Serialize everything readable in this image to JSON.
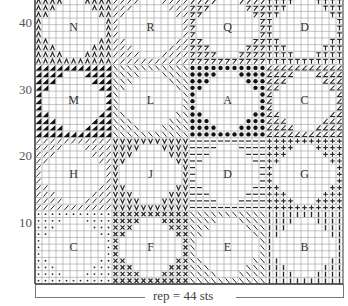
{
  "chart_title": "",
  "grid": {
    "columns": 44,
    "rows_visible": 44,
    "origin_x": 35,
    "bottom_y": 284,
    "cell_w": 7,
    "cell_h": 6.65,
    "line_color": "#9a9a9a",
    "symbol_color": "#2a2a2a",
    "border_color": "#333333"
  },
  "row_labels": [
    {
      "row": 10,
      "label": "10"
    },
    {
      "row": 20,
      "label": "20"
    },
    {
      "row": 30,
      "label": "30"
    },
    {
      "row": 40,
      "label": "40"
    }
  ],
  "repeat_label": "rep = 44 sts",
  "blocks": [
    {
      "letter": "C",
      "band": 0,
      "col": 0,
      "symbol": "dot"
    },
    {
      "letter": "F",
      "band": 0,
      "col": 1,
      "symbol": "cross"
    },
    {
      "letter": "E",
      "band": 0,
      "col": 2,
      "symbol": "backslash"
    },
    {
      "letter": "B",
      "band": 0,
      "col": 3,
      "symbol": "vbar"
    },
    {
      "letter": "H",
      "band": 1,
      "col": 0,
      "symbol": "slash"
    },
    {
      "letter": "J",
      "band": 1,
      "col": 1,
      "symbol": "vee"
    },
    {
      "letter": "D",
      "band": 1,
      "col": 2,
      "symbol": "dash"
    },
    {
      "letter": "G",
      "band": 1,
      "col": 3,
      "symbol": "plus"
    },
    {
      "letter": "M",
      "band": 2,
      "col": 0,
      "symbol": "blacktri"
    },
    {
      "letter": "L",
      "band": 2,
      "col": 1,
      "symbol": "backslash"
    },
    {
      "letter": "A",
      "band": 2,
      "col": 2,
      "symbol": "bigdot"
    },
    {
      "letter": "C",
      "band": 2,
      "col": 3,
      "symbol": "angle"
    },
    {
      "letter": "N",
      "band": 3,
      "col": 0,
      "symbol": "lambda"
    },
    {
      "letter": "R",
      "band": 3,
      "col": 1,
      "symbol": "slash"
    },
    {
      "letter": "Q",
      "band": 3,
      "col": 2,
      "symbol": "seven"
    },
    {
      "letter": "D",
      "band": 3,
      "col": 3,
      "symbol": "tee"
    }
  ],
  "chart_data": {
    "type": "table",
    "repeat_stitches": 44,
    "row_ticks": [
      10,
      20,
      30,
      40
    ],
    "block_size": {
      "stitches": 11,
      "rows": 11
    },
    "layout_rows_bottom_to_top": [
      [
        "C",
        "F",
        "E",
        "B"
      ],
      [
        "H",
        "J",
        "D",
        "G"
      ],
      [
        "M",
        "L",
        "A",
        "C"
      ],
      [
        "N",
        "R",
        "Q",
        "D"
      ]
    ],
    "xlabel": "rep = 44 sts",
    "ylabel": "rows"
  }
}
